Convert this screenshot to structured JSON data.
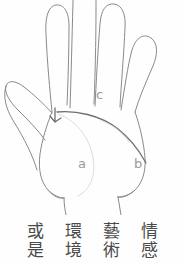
{
  "figure": {
    "type": "hand-palm-line-drawing",
    "line_color": "#8a8a8a",
    "crease_color": "#6f6f6f",
    "faint_color": "#d8d8d8",
    "label_color": "#9a9a9a",
    "background_color": "#fefefe"
  },
  "labels": [
    {
      "id": "a",
      "text": "a"
    },
    {
      "id": "b",
      "text": "b"
    },
    {
      "id": "c",
      "text": "c"
    }
  ],
  "caption": {
    "text_color": "#4a4a4a",
    "reading_order": "right-to-left",
    "terms": [
      {
        "id": "term-1",
        "chars": [
          "情",
          "感"
        ],
        "text": "情感"
      },
      {
        "id": "term-2",
        "chars": [
          "藝",
          "術"
        ],
        "text": "藝術"
      },
      {
        "id": "term-3",
        "chars": [
          "環",
          "境"
        ],
        "text": "環境"
      },
      {
        "id": "term-4",
        "chars": [
          "或",
          "是"
        ],
        "text": "或是"
      }
    ]
  }
}
